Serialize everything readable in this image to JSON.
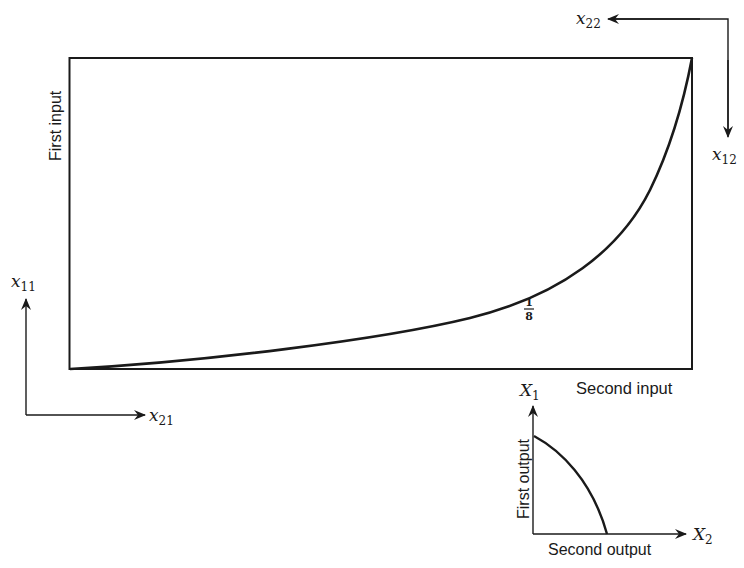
{
  "diagram": {
    "box": {
      "x_label": "Second input",
      "y_label": "First input",
      "curve_label_num": "1",
      "curve_label_den": "8"
    },
    "origin_bottom_left": {
      "vertical_axis_label": "x",
      "vertical_axis_sub": "11",
      "horizontal_axis_label": "x",
      "horizontal_axis_sub": "21"
    },
    "origin_top_right": {
      "horizontal_axis_label": "x",
      "horizontal_axis_sub": "22",
      "vertical_axis_label": "x",
      "vertical_axis_sub": "12"
    },
    "output_frontier": {
      "y_axis_label": "X",
      "y_axis_sub": "1",
      "x_axis_label": "X",
      "x_axis_sub": "2",
      "y_title": "First output",
      "x_title": "Second output"
    },
    "colors": {
      "ink": "#1a1a1a",
      "background": "#ffffff"
    }
  }
}
